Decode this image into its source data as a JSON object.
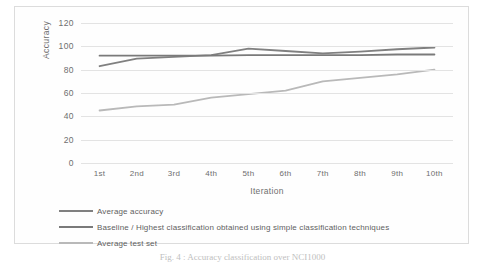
{
  "figure": {
    "caption": "Fig. 4 : Accuracy classification over NCI1000"
  },
  "chart_data": {
    "type": "line",
    "title": "",
    "xlabel": "Iteration",
    "ylabel": "Accuracy",
    "categories": [
      "1st",
      "2nd",
      "3rd",
      "4th",
      "5th",
      "6th",
      "7th",
      "8th",
      "9th",
      "10th"
    ],
    "ylim": [
      0,
      120
    ],
    "yticks": [
      0,
      20,
      40,
      60,
      80,
      100,
      120
    ],
    "grid": "horizontal",
    "legend_position": "bottom-left",
    "series": [
      {
        "name": "Average accuracy",
        "color": "#808080",
        "values": [
          83,
          89.5,
          91,
          92.5,
          98,
          96,
          94,
          95.5,
          97.5,
          99
        ]
      },
      {
        "name": "Baseline / Highest classification obtained using simple classification techniques",
        "color": "#7a7a7a",
        "values": [
          92,
          92,
          92,
          92,
          92.5,
          92.5,
          92.5,
          92.5,
          93,
          93
        ]
      },
      {
        "name": "Average test set",
        "color": "#b9b9b9",
        "values": [
          45,
          48.5,
          50,
          56,
          59,
          62,
          70,
          73,
          76,
          80
        ]
      }
    ]
  }
}
